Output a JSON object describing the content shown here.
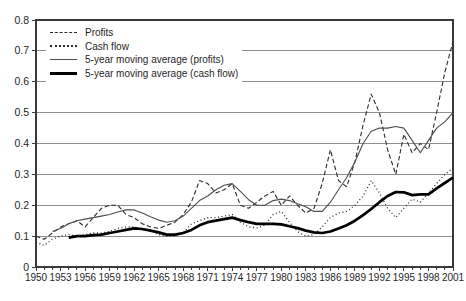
{
  "figure": {
    "background": "#ffffff",
    "axis_color": "#3a3a3a",
    "grid_color": "#8f8f8f",
    "text_color": "#1f1f1f"
  },
  "chart_data": {
    "type": "line",
    "title": "",
    "xlabel": "",
    "ylabel": "",
    "grid": "horizontal",
    "legend_position": "top-left",
    "xlim": [
      1950,
      2001
    ],
    "ylim": [
      0,
      0.8
    ],
    "x_label_step_years": 3,
    "y_tick_values": [
      0,
      0.1,
      0.2,
      0.3,
      0.4,
      0.5,
      0.6,
      0.7,
      0.8
    ],
    "y_tick_labels": [
      "0",
      "0.1",
      "0.2",
      "0.3",
      "0.4",
      "0.5",
      "0.6",
      "0.7",
      "0.8"
    ],
    "x_tick_labels": [
      "1950",
      "1953",
      "1956",
      "1959",
      "1962",
      "1965",
      "1968",
      "1971",
      "1974",
      "1977",
      "1980",
      "1983",
      "1986",
      "1989",
      "1992",
      "1995",
      "1998",
      "2001"
    ],
    "x": [
      1950,
      1951,
      1952,
      1953,
      1954,
      1955,
      1956,
      1957,
      1958,
      1959,
      1960,
      1961,
      1962,
      1963,
      1964,
      1965,
      1966,
      1967,
      1968,
      1969,
      1970,
      1971,
      1972,
      1973,
      1974,
      1975,
      1976,
      1977,
      1978,
      1979,
      1980,
      1981,
      1982,
      1983,
      1984,
      1985,
      1986,
      1987,
      1988,
      1989,
      1990,
      1991,
      1992,
      1993,
      1994,
      1995,
      1996,
      1997,
      1998,
      1999,
      2000,
      2001
    ],
    "series": [
      {
        "name": "Profits",
        "style": "dashed",
        "color": "#2b2b2b",
        "width": 1.1,
        "values": [
          0.1,
          0.09,
          0.11,
          0.13,
          0.14,
          0.15,
          0.13,
          0.16,
          0.19,
          0.2,
          0.2,
          0.17,
          0.16,
          0.14,
          0.13,
          0.125,
          0.135,
          0.145,
          0.17,
          0.21,
          0.28,
          0.27,
          0.24,
          0.25,
          0.27,
          0.2,
          0.19,
          0.21,
          0.23,
          0.245,
          0.2,
          0.23,
          0.2,
          0.175,
          0.19,
          0.27,
          0.38,
          0.28,
          0.26,
          0.34,
          0.46,
          0.56,
          0.5,
          0.38,
          0.3,
          0.43,
          0.37,
          0.4,
          0.38,
          0.5,
          0.63,
          0.73
        ]
      },
      {
        "name": "Cash flow",
        "style": "dotted",
        "color": "#2b2b2b",
        "width": 1.3,
        "values": [
          0.08,
          0.07,
          0.09,
          0.1,
          0.105,
          0.1,
          0.105,
          0.11,
          0.11,
          0.115,
          0.125,
          0.13,
          0.13,
          0.12,
          0.12,
          0.105,
          0.1,
          0.1,
          0.11,
          0.14,
          0.15,
          0.16,
          0.16,
          0.165,
          0.17,
          0.145,
          0.13,
          0.127,
          0.135,
          0.17,
          0.18,
          0.145,
          0.115,
          0.1,
          0.105,
          0.13,
          0.16,
          0.175,
          0.18,
          0.2,
          0.23,
          0.28,
          0.24,
          0.19,
          0.16,
          0.19,
          0.22,
          0.21,
          0.24,
          0.27,
          0.3,
          0.32
        ]
      },
      {
        "name": "5-year moving average (profits)",
        "style": "solid",
        "color": "#4d4d4d",
        "width": 1.1,
        "values": [
          null,
          null,
          0.115,
          0.125,
          0.14,
          0.15,
          0.155,
          0.16,
          0.165,
          0.17,
          0.178,
          0.185,
          0.185,
          0.175,
          0.163,
          0.152,
          0.145,
          0.15,
          0.165,
          0.19,
          0.215,
          0.23,
          0.25,
          0.265,
          0.27,
          0.245,
          0.218,
          0.2,
          0.2,
          0.215,
          0.22,
          0.215,
          0.205,
          0.195,
          0.18,
          0.18,
          0.21,
          0.25,
          0.29,
          0.34,
          0.4,
          0.44,
          0.45,
          0.45,
          0.455,
          0.45,
          0.41,
          0.37,
          0.41,
          0.45,
          0.47,
          0.5
        ]
      },
      {
        "name": "5-year moving average (cash flow)",
        "style": "solid",
        "color": "#000000",
        "width": 2.7,
        "values": [
          null,
          null,
          null,
          null,
          0.095,
          0.1,
          0.1,
          0.103,
          0.105,
          0.11,
          0.115,
          0.12,
          0.125,
          0.123,
          0.118,
          0.112,
          0.105,
          0.105,
          0.11,
          0.12,
          0.135,
          0.145,
          0.15,
          0.155,
          0.16,
          0.152,
          0.145,
          0.14,
          0.14,
          0.14,
          0.138,
          0.132,
          0.126,
          0.118,
          0.112,
          0.11,
          0.115,
          0.125,
          0.135,
          0.15,
          0.168,
          0.188,
          0.21,
          0.23,
          0.243,
          0.242,
          0.233,
          0.235,
          0.235,
          0.255,
          0.272,
          0.29
        ]
      }
    ]
  }
}
